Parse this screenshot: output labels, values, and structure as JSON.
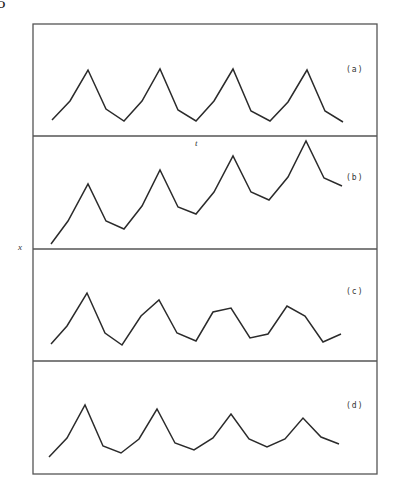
{
  "page": {
    "number_fragment": "5"
  },
  "figure": {
    "frame": {
      "left": 33,
      "top": 24,
      "right": 377,
      "bottom": 474
    },
    "dividers": [
      136,
      249,
      361
    ],
    "stroke_color": "#2b2b2b",
    "frame_color": "#555555",
    "xlabel": "t",
    "ylabel": "x"
  },
  "chart_data": [
    {
      "type": "line",
      "panel": "(a)",
      "title": "(a)",
      "xlabel": "t",
      "ylabel": "x",
      "grid": false,
      "legend": "none",
      "x": [
        0,
        1,
        2,
        3,
        4,
        5,
        6,
        7,
        8,
        9,
        10,
        11,
        12,
        13,
        14,
        15,
        16
      ],
      "series": [
        {
          "name": "x(t)",
          "values": [
            14,
            31,
            59,
            24,
            14,
            31,
            60,
            23,
            13,
            31,
            60,
            22,
            13,
            30,
            59,
            22,
            12
          ]
        }
      ],
      "ylim": [
        0,
        100
      ],
      "pixel_points": [
        [
          52,
          120
        ],
        [
          70,
          101
        ],
        [
          88,
          70
        ],
        [
          106,
          109
        ],
        [
          124,
          121
        ],
        [
          142,
          101
        ],
        [
          160,
          69
        ],
        [
          178,
          110
        ],
        [
          196,
          121
        ],
        [
          214,
          101
        ],
        [
          233,
          69
        ],
        [
          251,
          111
        ],
        [
          270,
          121
        ],
        [
          288,
          102
        ],
        [
          307,
          70
        ],
        [
          325,
          111
        ],
        [
          343,
          122
        ]
      ]
    },
    {
      "type": "line",
      "panel": "(b)",
      "title": "(b)",
      "xlabel": "t",
      "ylabel": "x",
      "grid": false,
      "legend": "none",
      "x": [
        0,
        1,
        2,
        3,
        4,
        5,
        6,
        7,
        8,
        9,
        10,
        11,
        12,
        13,
        14,
        15,
        16
      ],
      "series": [
        {
          "name": "x(t)",
          "values": [
            4,
            25,
            58,
            25,
            18,
            38,
            70,
            37,
            31,
            50,
            82,
            50,
            43,
            64,
            96,
            63,
            56
          ]
        }
      ],
      "ylim": [
        0,
        100
      ],
      "pixel_points": [
        [
          51,
          244
        ],
        [
          68,
          221
        ],
        [
          88,
          184
        ],
        [
          106,
          221
        ],
        [
          124,
          229
        ],
        [
          142,
          206
        ],
        [
          160,
          170
        ],
        [
          178,
          207
        ],
        [
          196,
          214
        ],
        [
          214,
          192
        ],
        [
          233,
          156
        ],
        [
          251,
          192
        ],
        [
          269,
          200
        ],
        [
          288,
          177
        ],
        [
          306,
          141
        ],
        [
          324,
          178
        ],
        [
          342,
          186
        ]
      ]
    },
    {
      "type": "line",
      "panel": "(c)",
      "title": "(c)",
      "xlabel": "t",
      "ylabel": "x",
      "grid": false,
      "legend": "none",
      "x": [
        0,
        1,
        2,
        3,
        4,
        5,
        6,
        7,
        8,
        9,
        10,
        11,
        12,
        13,
        14,
        15,
        16
      ],
      "series": [
        {
          "name": "x(t)",
          "values": [
            15,
            31,
            61,
            25,
            14,
            40,
            54,
            25,
            18,
            44,
            47,
            21,
            24,
            49,
            40,
            17,
            24
          ]
        }
      ],
      "ylim": [
        0,
        100
      ],
      "pixel_points": [
        [
          51,
          344
        ],
        [
          67,
          326
        ],
        [
          87,
          293
        ],
        [
          105,
          333
        ],
        [
          122,
          345
        ],
        [
          141,
          316
        ],
        [
          159,
          300
        ],
        [
          177,
          333
        ],
        [
          196,
          341
        ],
        [
          213,
          312
        ],
        [
          231,
          308
        ],
        [
          250,
          338
        ],
        [
          268,
          334
        ],
        [
          287,
          306
        ],
        [
          305,
          316
        ],
        [
          323,
          342
        ],
        [
          341,
          334
        ]
      ]
    },
    {
      "type": "line",
      "panel": "(d)",
      "title": "(d)",
      "xlabel": "t",
      "ylabel": "x",
      "grid": false,
      "legend": "none",
      "x": [
        0,
        1,
        2,
        3,
        4,
        5,
        6,
        7,
        8,
        9,
        10,
        11,
        12,
        13,
        14,
        15,
        16
      ],
      "series": [
        {
          "name": "x(t)",
          "values": [
            15,
            32,
            61,
            25,
            19,
            31,
            58,
            27,
            21,
            32,
            53,
            31,
            24,
            31,
            50,
            33,
            27
          ]
        }
      ],
      "ylim": [
        0,
        100
      ],
      "pixel_points": [
        [
          49,
          457
        ],
        [
          67,
          438
        ],
        [
          85,
          405
        ],
        [
          103,
          446
        ],
        [
          121,
          453
        ],
        [
          139,
          439
        ],
        [
          157,
          409
        ],
        [
          175,
          443
        ],
        [
          194,
          450
        ],
        [
          213,
          438
        ],
        [
          231,
          414
        ],
        [
          249,
          439
        ],
        [
          267,
          447
        ],
        [
          285,
          439
        ],
        [
          303,
          418
        ],
        [
          321,
          437
        ],
        [
          339,
          444
        ]
      ]
    }
  ],
  "panels": [
    {
      "label": "(a)",
      "label_pos": [
        346,
        72
      ]
    },
    {
      "label": "(b)",
      "label_pos": [
        346,
        180
      ]
    },
    {
      "label": "(c)",
      "label_pos": [
        346,
        294
      ]
    },
    {
      "label": "(d)",
      "label_pos": [
        346,
        408
      ]
    }
  ],
  "axis_labels": {
    "t": {
      "text": "t",
      "pos": [
        196,
        144
      ]
    },
    "x": {
      "text": "x",
      "pos": [
        19,
        249
      ]
    }
  }
}
